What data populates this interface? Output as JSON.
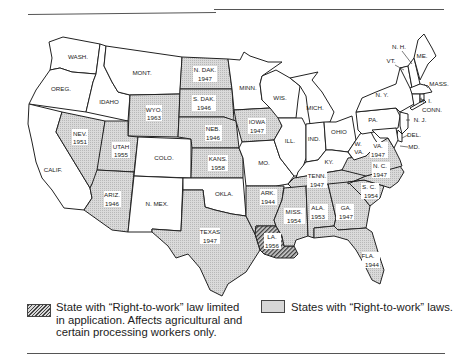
{
  "colors": {
    "free": "#ffffff",
    "rtw_fill": "#d6d6d6",
    "limited_fill": "#555555",
    "border": "#222222"
  },
  "legend": {
    "limited": {
      "label": "State with \"Right-to-work\" law limited in application. Affects agricultural and certain processing workers only.",
      "line1": "State with “Right-to-work” law limited",
      "line2": "in application. Affects agricultural and",
      "line3": "certain processing workers only."
    },
    "rtw": {
      "label": "States with “Right-to-work” laws."
    }
  },
  "states": [
    {
      "name": "WASH.",
      "year": null,
      "status": "none"
    },
    {
      "name": "OREG.",
      "year": null,
      "status": "none"
    },
    {
      "name": "CALIF.",
      "year": null,
      "status": "none"
    },
    {
      "name": "IDAHO",
      "year": null,
      "status": "none"
    },
    {
      "name": "NEV.",
      "year": "1951",
      "status": "rtw"
    },
    {
      "name": "MONT.",
      "year": null,
      "status": "none"
    },
    {
      "name": "WYO.",
      "year": "1963",
      "status": "rtw"
    },
    {
      "name": "UTAH",
      "year": "1955",
      "status": "rtw"
    },
    {
      "name": "ARIZ.",
      "year": "1946",
      "status": "rtw"
    },
    {
      "name": "COLO.",
      "year": null,
      "status": "none"
    },
    {
      "name": "N. MEX.",
      "year": null,
      "status": "none"
    },
    {
      "name": "N. DAK.",
      "year": "1947",
      "status": "rtw"
    },
    {
      "name": "S. DAK.",
      "year": "1946",
      "status": "rtw"
    },
    {
      "name": "NEB.",
      "year": "1946",
      "status": "rtw"
    },
    {
      "name": "KANS.",
      "year": "1958",
      "status": "rtw"
    },
    {
      "name": "OKLA.",
      "year": null,
      "status": "none"
    },
    {
      "name": "TEXAS",
      "year": "1947",
      "status": "rtw"
    },
    {
      "name": "MINN.",
      "year": null,
      "status": "none"
    },
    {
      "name": "IOWA",
      "year": "1947",
      "status": "rtw"
    },
    {
      "name": "MO.",
      "year": null,
      "status": "none"
    },
    {
      "name": "ARK.",
      "year": "1944",
      "status": "rtw"
    },
    {
      "name": "LA.",
      "year": "1956",
      "status": "limited"
    },
    {
      "name": "WIS.",
      "year": null,
      "status": "none"
    },
    {
      "name": "ILL.",
      "year": null,
      "status": "none"
    },
    {
      "name": "MICH.",
      "year": null,
      "status": "none"
    },
    {
      "name": "IND.",
      "year": null,
      "status": "none"
    },
    {
      "name": "OHIO",
      "year": null,
      "status": "none"
    },
    {
      "name": "KY.",
      "year": null,
      "status": "none"
    },
    {
      "name": "TENN.",
      "year": "1947",
      "status": "rtw"
    },
    {
      "name": "MISS.",
      "year": "1954",
      "status": "rtw"
    },
    {
      "name": "ALA.",
      "year": "1953",
      "status": "rtw"
    },
    {
      "name": "GA.",
      "year": "1947",
      "status": "rtw"
    },
    {
      "name": "FLA.",
      "year": "1944",
      "status": "rtw"
    },
    {
      "name": "S. C.",
      "year": "1954",
      "status": "rtw"
    },
    {
      "name": "N. C.",
      "year": "1947",
      "status": "rtw"
    },
    {
      "name": "VA.",
      "year": "1947",
      "status": "rtw"
    },
    {
      "name": "W. VA.",
      "year": null,
      "status": "none"
    },
    {
      "name": "PA.",
      "year": null,
      "status": "none"
    },
    {
      "name": "N. Y.",
      "year": null,
      "status": "none"
    },
    {
      "name": "VT.",
      "year": null,
      "status": "none"
    },
    {
      "name": "N. H.",
      "year": null,
      "status": "none"
    },
    {
      "name": "ME.",
      "year": null,
      "status": "none"
    },
    {
      "name": "MASS.",
      "year": null,
      "status": "none"
    },
    {
      "name": "R. I.",
      "year": null,
      "status": "none"
    },
    {
      "name": "CONN.",
      "year": null,
      "status": "none"
    },
    {
      "name": "N. J.",
      "year": null,
      "status": "none"
    },
    {
      "name": "DEL.",
      "year": null,
      "status": "none"
    },
    {
      "name": "MD.",
      "year": null,
      "status": "none"
    }
  ],
  "labels": {
    "wash": "WASH.",
    "oreg": "OREG.",
    "calif": "CALIF.",
    "idaho": "IDAHO",
    "nev": "NEV.",
    "nev_y": "1951",
    "mont": "MONT.",
    "wyo": "WYO.",
    "wyo_y": "1963",
    "utah": "UTAH",
    "utah_y": "1955",
    "ariz": "ARIZ.",
    "ariz_y": "1946",
    "colo": "COLO.",
    "nmex": "N. MEX.",
    "ndak": "N. DAK.",
    "ndak_y": "1947",
    "sdak": "S. DAK.",
    "sdak_y": "1946",
    "neb": "NEB.",
    "neb_y": "1946",
    "kans": "KANS.",
    "kans_y": "1958",
    "okla": "OKLA.",
    "texas": "TEXAS",
    "texas_y": "1947",
    "minn": "MINN.",
    "iowa": "IOWA",
    "iowa_y": "1947",
    "mo": "MO.",
    "ark": "ARK.",
    "ark_y": "1944",
    "la": "LA.",
    "la_y": "1956",
    "wis": "WIS.",
    "ill": "ILL.",
    "mich": "MICH.",
    "ind": "IND.",
    "ohio": "OHIO",
    "ky": "KY.",
    "tenn": "TENN.",
    "tenn_y": "1947",
    "miss": "MISS.",
    "miss_y": "1954",
    "ala": "ALA.",
    "ala_y": "1953",
    "ga": "GA.",
    "ga_y": "1947",
    "fla": "FLA.",
    "fla_y": "1944",
    "sc": "S. C.",
    "sc_y": "1954",
    "nc": "N. C.",
    "nc_y": "1947",
    "va": "VA.",
    "va_y": "1947",
    "wva1": "W.",
    "wva2": "VA.",
    "pa": "PA.",
    "ny": "N. Y.",
    "vt": "VT.",
    "nh": "N. H.",
    "me": "ME.",
    "mass": "MASS.",
    "ri": "R. I.",
    "conn": "CONN.",
    "nj": "N. J.",
    "del": "DEL.",
    "md": "MD."
  }
}
